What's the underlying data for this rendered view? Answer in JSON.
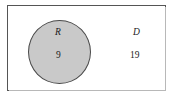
{
  "figure": {
    "type": "venn-diagram",
    "universe": {
      "name": "universal-set-rectangle",
      "border_color": "#555555",
      "fill_color": "#ffffff"
    },
    "sets": [
      {
        "label": "R",
        "count": "9",
        "shaded": true,
        "fill_color": "#c9c9c9",
        "border_color": "#4a4a4a"
      }
    ],
    "outside": {
      "label": "D",
      "count": "19"
    }
  },
  "chart_data": {
    "type": "venn",
    "title": "",
    "regions": [
      {
        "label": "R",
        "value": 9,
        "inside_circle": true
      },
      {
        "label": "D",
        "value": 19,
        "inside_circle": false
      }
    ],
    "categories": [
      "R",
      "D"
    ],
    "values": [
      9,
      19
    ],
    "legend": "none",
    "grid": false
  }
}
